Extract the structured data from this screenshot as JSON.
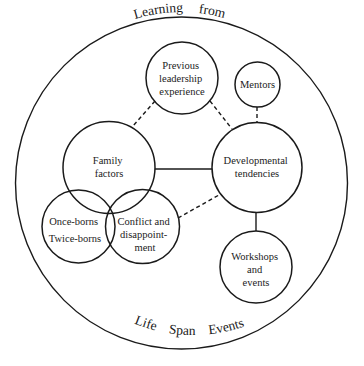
{
  "title_top": "Learning from",
  "title_bottom": "Life Span Events",
  "top_words": [
    "Learning",
    "from"
  ],
  "bottom_words": [
    "Life",
    "Span",
    "Events"
  ],
  "nodes": {
    "previous_leadership": {
      "lines": [
        "Previous",
        "leadership",
        "experience"
      ]
    },
    "mentors": {
      "lines": [
        "Mentors"
      ]
    },
    "family_factors": {
      "lines": [
        "Family",
        "factors"
      ]
    },
    "developmental_tendencies": {
      "lines": [
        "Developmental",
        "tendencies"
      ]
    },
    "once_twice_borns": {
      "lines": [
        "Once-borns",
        "Twice-borns"
      ]
    },
    "conflict_disappointment": {
      "lines": [
        "Conflict and",
        "disappoint-",
        "ment"
      ]
    },
    "workshops_events": {
      "lines": [
        "Workshops",
        "and",
        "events"
      ]
    }
  },
  "links": [
    {
      "from": "previous_leadership",
      "to": "family_factors",
      "style": "dashed"
    },
    {
      "from": "previous_leadership",
      "to": "developmental_tendencies",
      "style": "dashed"
    },
    {
      "from": "mentors",
      "to": "developmental_tendencies",
      "style": "dashed"
    },
    {
      "from": "family_factors",
      "to": "developmental_tendencies",
      "style": "solid"
    },
    {
      "from": "conflict_disappointment",
      "to": "developmental_tendencies",
      "style": "dashed"
    },
    {
      "from": "developmental_tendencies",
      "to": "workshops_events",
      "style": "solid"
    }
  ]
}
